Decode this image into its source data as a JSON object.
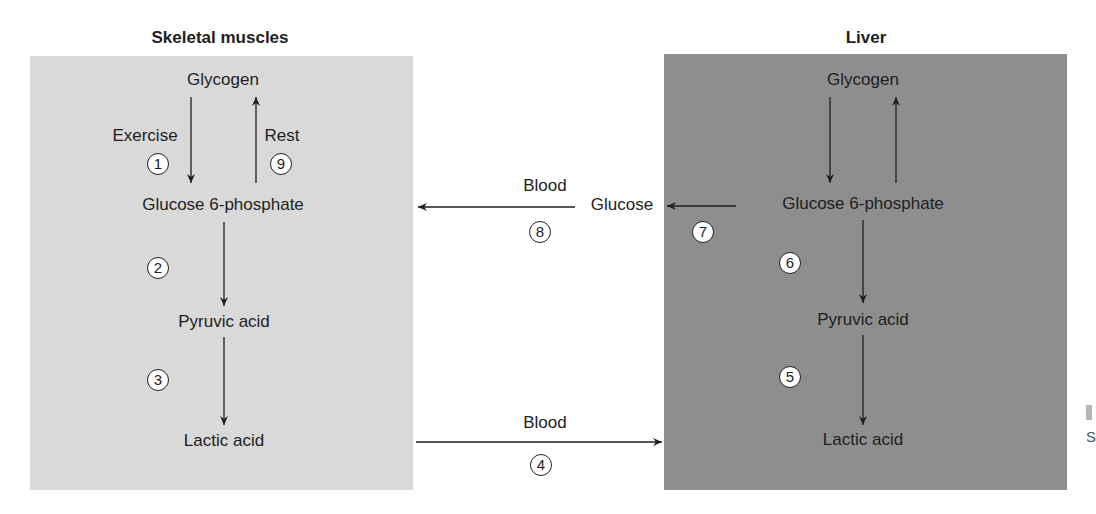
{
  "colors": {
    "muscle_panel": "#d9d9d9",
    "liver_panel": "#8e8e8e",
    "background": "#ffffff",
    "ink": "#1e1e1e",
    "step_fill": "#ffffff"
  },
  "muscle": {
    "title": "Skeletal muscles",
    "nodes": {
      "glycogen": "Glycogen",
      "g6p": "Glucose 6-phosphate",
      "pyruvic": "Pyruvic acid",
      "lactic": "Lactic acid"
    },
    "labels": {
      "exercise": "Exercise",
      "rest": "Rest"
    },
    "steps": {
      "s1": "1",
      "s9": "9",
      "s2": "2",
      "s3": "3"
    }
  },
  "liver": {
    "title": "Liver",
    "nodes": {
      "glycogen": "Glycogen",
      "g6p": "Glucose 6-phosphate",
      "pyruvic": "Pyruvic acid",
      "lactic": "Lactic acid"
    },
    "steps": {
      "s7": "7",
      "s6": "6",
      "s5": "5"
    }
  },
  "transport": {
    "glucose_label": "Glucose",
    "blood_top": "Blood",
    "blood_bottom": "Blood",
    "steps": {
      "s8": "8",
      "s4": "4"
    }
  },
  "edge_clip": {
    "text": "S"
  },
  "diagram_data": {
    "type": "pathway",
    "title": "Cori cycle",
    "compartments": [
      "Skeletal muscles",
      "Blood",
      "Liver"
    ],
    "edges": [
      {
        "step": 1,
        "from": "Glycogen (muscle)",
        "to": "Glucose 6-phosphate (muscle)",
        "label": "Exercise"
      },
      {
        "step": 2,
        "from": "Glucose 6-phosphate (muscle)",
        "to": "Pyruvic acid (muscle)"
      },
      {
        "step": 3,
        "from": "Pyruvic acid (muscle)",
        "to": "Lactic acid (muscle)"
      },
      {
        "step": 4,
        "from": "Lactic acid (muscle)",
        "to": "Lactic acid (liver)",
        "label": "Blood"
      },
      {
        "step": 5,
        "from": "Lactic acid (liver)",
        "to": "Pyruvic acid (liver)"
      },
      {
        "step": 6,
        "from": "Pyruvic acid (liver)",
        "to": "Glucose 6-phosphate (liver)"
      },
      {
        "step": 7,
        "from": "Glucose 6-phosphate (liver)",
        "to": "Glucose"
      },
      {
        "step": 8,
        "from": "Glucose",
        "to": "Glucose 6-phosphate (muscle)",
        "label": "Blood"
      },
      {
        "step": 9,
        "from": "Glucose 6-phosphate (muscle)",
        "to": "Glycogen (muscle)",
        "label": "Rest"
      }
    ]
  }
}
